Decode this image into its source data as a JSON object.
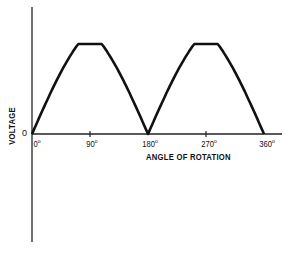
{
  "chart_data": {
    "type": "line",
    "title": "",
    "xlabel": "ANGLE OF ROTATION",
    "ylabel": "VOLTAGE",
    "x_ticks": [
      "0°",
      "90°",
      "180°",
      "270°",
      "360°"
    ],
    "y_ticks": [
      "0"
    ],
    "x": [
      0,
      30,
      60,
      90,
      120,
      150,
      180,
      210,
      240,
      270,
      300,
      330,
      360
    ],
    "series": [
      {
        "name": "Rectified voltage (full-wave)",
        "values": [
          0,
          0.62,
          0.95,
          1.0,
          0.95,
          0.62,
          0,
          0.62,
          0.95,
          1.0,
          0.95,
          0.62,
          0
        ]
      }
    ],
    "xlim": [
      0,
      360
    ],
    "ylim": [
      -1.2,
      1.2
    ],
    "grid": false,
    "legend": "none",
    "line_color": "#111111"
  },
  "labels": {
    "ylabel": "VOLTAGE",
    "xlabel": "ANGLE OF ROTATION",
    "zero": "0",
    "ticks": [
      {
        "value": "0",
        "unit": "o"
      },
      {
        "value": "90",
        "unit": "o"
      },
      {
        "value": "180",
        "unit": "o"
      },
      {
        "value": "270",
        "unit": "o"
      },
      {
        "value": "360",
        "unit": "o"
      }
    ]
  }
}
